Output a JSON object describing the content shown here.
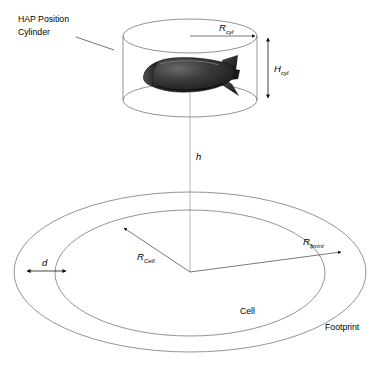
{
  "figure": {
    "background_color": "#ffffff",
    "line_color": "#000000",
    "airship_color": "#2b2b2b"
  },
  "labels": {
    "hap_line1": "HAP Position",
    "hap_line2": "Cylinder",
    "r_cyl_symbol": "R",
    "r_cyl_subscript": "cyl",
    "h_cyl_symbol": "H",
    "h_cyl_subscript": "cyl",
    "altitude": "h",
    "r_cell_symbol": "R",
    "r_cell_subscript": "Cell",
    "r_fprint_symbol": "R",
    "r_fprint_subscript": "fprint",
    "d_symbol": "d",
    "cell": "Cell",
    "footprint": "Footprint"
  },
  "shapes": {
    "cylinder": {
      "name": "hap-position-cylinder",
      "center_x": 190,
      "top_ellipse_cy": 36,
      "bottom_ellipse_cy": 100,
      "rx": 67,
      "ry": 17
    },
    "airship": {
      "name": "high-altitude-platform-airship",
      "center_x": 183,
      "center_y": 78
    },
    "footprint_ellipse": {
      "name": "footprint-outer-ellipse",
      "center_x": 190,
      "center_y": 272,
      "rx": 176,
      "ry": 80
    },
    "cell_ellipse": {
      "name": "cell-inner-ellipse",
      "center_x": 190,
      "center_y": 273,
      "rx": 135,
      "ry": 63
    },
    "altitude_line": {
      "name": "altitude-drop-line",
      "x": 190,
      "y_top": 108,
      "y_bottom": 272
    }
  },
  "dimensions": {
    "r_cyl": {
      "x1": 190,
      "y1": 36,
      "x2": 257,
      "y2": 36
    },
    "h_cyl": {
      "x": 268,
      "y1": 36,
      "y2": 100
    },
    "r_cell": {
      "x1": 190,
      "y1": 272,
      "x2": 122,
      "y2": 227
    },
    "r_fprint": {
      "x1": 190,
      "y1": 272,
      "x2": 342,
      "y2": 252
    },
    "d": {
      "x1": 25,
      "x2": 68,
      "y": 271
    }
  }
}
